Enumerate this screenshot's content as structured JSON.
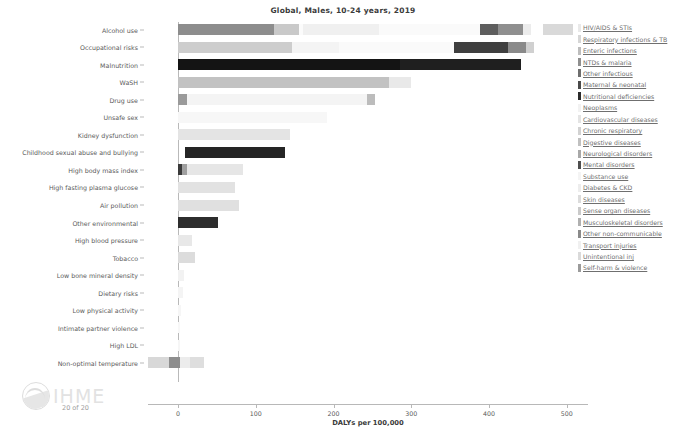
{
  "chart": {
    "title": "Global, Males, 10-24 years, 2019",
    "xlabel": "DALYs per 100,000",
    "watermark": "IHME",
    "page_count": "20 of 20"
  },
  "chart_data": {
    "type": "bar",
    "orientation": "horizontal",
    "stacked": true,
    "title": "Global, Males, 10-24 years, 2019",
    "xlabel": "DALYs per 100,000",
    "ylabel": "",
    "xlim": [
      -40,
      525
    ],
    "xticks": [
      0,
      100,
      200,
      300,
      400,
      500
    ],
    "xticklabels": [
      "0",
      "100",
      "200",
      "300",
      "400",
      "500"
    ],
    "grid": false,
    "legend_position": "right",
    "categories": [
      "Alcohol use",
      "Occupational risks",
      "Malnutrition",
      "WaSH",
      "Drug use",
      "Unsafe sex",
      "Kidney dysfunction",
      "Childhood sexual abuse and bullying",
      "High body mass index",
      "High fasting plasma glucose",
      "Air pollution",
      "Other environmental",
      "High blood pressure",
      "Tobacco",
      "Low bone mineral density",
      "Dietary risks",
      "Low physical activity",
      "Intimate partner violence",
      "High LDL",
      "Non-optimal temperature"
    ],
    "legend": [
      {
        "label": "HIV/AIDS & STIs",
        "color": "#e9e9e9"
      },
      {
        "label": "Respiratory infections & TB",
        "color": "#d6d6d6"
      },
      {
        "label": "Enteric infections",
        "color": "#bdbdbd"
      },
      {
        "label": "NTDs & malaria",
        "color": "#8f8f8f"
      },
      {
        "label": "Other infectious",
        "color": "#6e6e6e"
      },
      {
        "label": "Maternal & neonatal",
        "color": "#4a4a4a"
      },
      {
        "label": "Nutritional deficiencies",
        "color": "#2b2b2b"
      },
      {
        "label": "Neoplasms",
        "color": "#f2f2f2"
      },
      {
        "label": "Cardiovascular diseases",
        "color": "#e4e4e4"
      },
      {
        "label": "Chronic respiratory",
        "color": "#d2d2d2"
      },
      {
        "label": "Digestive diseases",
        "color": "#c0c0c0"
      },
      {
        "label": "Neurological disorders",
        "color": "#a8a8a8"
      },
      {
        "label": "Mental disorders",
        "color": "#4e4e4e"
      },
      {
        "label": "Substance use",
        "color": "#f4f4f4"
      },
      {
        "label": "Diabetes & CKD",
        "color": "#ededed"
      },
      {
        "label": "Skin diseases",
        "color": "#dcdcdc"
      },
      {
        "label": "Sense organ diseases",
        "color": "#cacaca"
      },
      {
        "label": "Musculoskeletal disorders",
        "color": "#b0b0b0"
      },
      {
        "label": "Other non-communicable",
        "color": "#8a8a8a"
      },
      {
        "label": "Transport injuries",
        "color": "#f0f0f0"
      },
      {
        "label": "Unintentional inj",
        "color": "#dadada"
      },
      {
        "label": "Self-harm & violence",
        "color": "#9b9b9b"
      }
    ],
    "bars": [
      {
        "category": "Alcohol use",
        "segments": [
          {
            "series": "Mental disorders",
            "start": 0,
            "value": 124,
            "color": "#8d8d8d"
          },
          {
            "series": "Substance use",
            "start": 124,
            "value": 32,
            "color": "#c9c9c9"
          },
          {
            "series": "Cardiovascular diseases",
            "start": 156,
            "value": 5,
            "color": "#fbfbfb"
          },
          {
            "series": "Digestive diseases",
            "start": 161,
            "value": 97,
            "color": "#f0f0f0"
          },
          {
            "series": "Other non-communicable",
            "start": 258,
            "value": 130,
            "color": "#fafafa"
          },
          {
            "series": "Transport injuries",
            "start": 388,
            "value": 23,
            "color": "#5e5e5e"
          },
          {
            "series": "Unintentional inj",
            "start": 411,
            "value": 33,
            "color": "#8f8f8f"
          },
          {
            "series": "Self-harm & violence",
            "start": 444,
            "value": 10,
            "color": "#ececec"
          },
          {
            "series": "Other",
            "start": 470,
            "value": 38,
            "color": "#d9d9d9"
          }
        ],
        "total": 508
      },
      {
        "category": "Occupational risks",
        "segments": [
          {
            "series": "Respiratory infections & TB",
            "start": 0,
            "value": 147,
            "color": "#cdcdcd"
          },
          {
            "series": "Chronic respiratory",
            "start": 147,
            "value": 60,
            "color": "#f4f4f4"
          },
          {
            "series": "Musculoskeletal disorders",
            "start": 207,
            "value": 148,
            "color": "#fafafa"
          },
          {
            "series": "Unintentional inj",
            "start": 355,
            "value": 70,
            "color": "#3f3f3f"
          },
          {
            "series": "Other",
            "start": 425,
            "value": 22,
            "color": "#8a8a8a"
          },
          {
            "series": "Other2",
            "start": 447,
            "value": 11,
            "color": "#d0d0d0"
          }
        ],
        "total": 458
      },
      {
        "category": "Malnutrition",
        "segments": [
          {
            "series": "Nutritional deficiencies",
            "start": 0,
            "value": 285,
            "color": "#141414"
          },
          {
            "series": "Enteric infections",
            "start": 285,
            "value": 156,
            "color": "#1f1f1f"
          }
        ],
        "total": 441
      },
      {
        "category": "WaSH",
        "segments": [
          {
            "series": "Enteric infections",
            "start": 0,
            "value": 272,
            "color": "#c2c2c2"
          },
          {
            "series": "NTDs & malaria",
            "start": 272,
            "value": 28,
            "color": "#e9e9e9"
          }
        ],
        "total": 300
      },
      {
        "category": "Drug use",
        "segments": [
          {
            "series": "HIV/AIDS & STIs",
            "start": 0,
            "value": 11,
            "color": "#9a9a9a"
          },
          {
            "series": "Mental disorders",
            "start": 11,
            "value": 232,
            "color": "#f4f4f4"
          },
          {
            "series": "Self-harm & violence",
            "start": 243,
            "value": 10,
            "color": "#bcbcbc"
          }
        ],
        "total": 253
      },
      {
        "category": "Unsafe sex",
        "segments": [
          {
            "series": "HIV/AIDS & STIs",
            "start": 0,
            "value": 192,
            "color": "#f7f7f7"
          }
        ],
        "total": 192
      },
      {
        "category": "Kidney dysfunction",
        "segments": [
          {
            "series": "Diabetes & CKD",
            "start": 0,
            "value": 144,
            "color": "#e4e4e4"
          }
        ],
        "total": 144
      },
      {
        "category": "Childhood sexual abuse and bullying",
        "segments": [
          {
            "series": "Mental disorders",
            "start": 9,
            "value": 128,
            "color": "#252525"
          }
        ],
        "total": 137
      },
      {
        "category": "High body mass index",
        "segments": [
          {
            "series": "Cardiovascular diseases",
            "start": 0,
            "value": 5,
            "color": "#3a3a3a"
          },
          {
            "series": "Diabetes & CKD",
            "start": 5,
            "value": 6,
            "color": "#9f9f9f"
          },
          {
            "series": "Other non-communicable",
            "start": 11,
            "value": 72,
            "color": "#e6e6e6"
          }
        ],
        "total": 83
      },
      {
        "category": "High fasting plasma glucose",
        "segments": [
          {
            "series": "Diabetes & CKD",
            "start": 0,
            "value": 73,
            "color": "#e2e2e2"
          }
        ],
        "total": 73
      },
      {
        "category": "Air pollution",
        "segments": [
          {
            "series": "Respiratory infections & TB",
            "start": 0,
            "value": 78,
            "color": "#e0e0e0"
          }
        ],
        "total": 78
      },
      {
        "category": "Other environmental",
        "segments": [
          {
            "series": "Unintentional inj",
            "start": 0,
            "value": 51,
            "color": "#2d2d2d"
          }
        ],
        "total": 51
      },
      {
        "category": "High blood pressure",
        "segments": [
          {
            "series": "Cardiovascular diseases",
            "start": 0,
            "value": 18,
            "color": "#e8e8e8"
          }
        ],
        "total": 18
      },
      {
        "category": "Tobacco",
        "segments": [
          {
            "series": "Chronic respiratory",
            "start": 0,
            "value": 22,
            "color": "#dcdcdc"
          }
        ],
        "total": 22
      },
      {
        "category": "Low bone mineral density",
        "segments": [
          {
            "series": "Unintentional inj",
            "start": 0,
            "value": 8,
            "color": "#f2f2f2"
          }
        ],
        "total": 8
      },
      {
        "category": "Dietary risks",
        "segments": [
          {
            "series": "Cardiovascular diseases",
            "start": 0,
            "value": 7,
            "color": "#f4f4f4"
          }
        ],
        "total": 7
      },
      {
        "category": "Low physical activity",
        "segments": [
          {
            "series": "Cardiovascular diseases",
            "start": 0,
            "value": 4,
            "color": "#f6f6f6"
          }
        ],
        "total": 4
      },
      {
        "category": "Intimate partner violence",
        "segments": [
          {
            "series": "Mental disorders",
            "start": 0,
            "value": 2,
            "color": "#f8f8f8"
          }
        ],
        "total": 2
      },
      {
        "category": "High LDL",
        "segments": [
          {
            "series": "Cardiovascular diseases",
            "start": 0,
            "value": 3,
            "color": "#f6f6f6"
          }
        ],
        "total": 3
      },
      {
        "category": "Non-optimal temperature",
        "segments": [
          {
            "series": "Respiratory infections & TB",
            "start": -38,
            "value": 26,
            "color": "#d8d8d8"
          },
          {
            "series": "Cardiovascular diseases",
            "start": -12,
            "value": 14,
            "color": "#8e8e8e"
          },
          {
            "series": "Other non-communicable",
            "start": 2,
            "value": 14,
            "color": "#ececec"
          },
          {
            "series": "Unintentional inj",
            "start": 16,
            "value": 18,
            "color": "#dedede"
          }
        ],
        "total": 34
      }
    ]
  }
}
